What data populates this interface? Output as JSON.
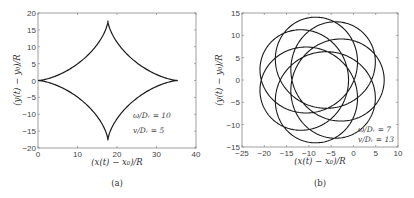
{
  "chart_data": [
    {
      "type": "line",
      "panel_caption": "(a)",
      "xlabel": "(x(t) − x₀)/R",
      "ylabel": "(y(t) − y₀)/R",
      "xlim": [
        0,
        40
      ],
      "ylim": [
        -20,
        20
      ],
      "xticks": [
        0,
        10,
        20,
        30,
        40
      ],
      "yticks": [
        -20,
        -15,
        -10,
        -5,
        0,
        5,
        10,
        15,
        20
      ],
      "grid": false,
      "annotations": [
        "ω/Dᵣ = 10",
        "v/Dᵣ = 5"
      ],
      "curve": {
        "shape": "astroid",
        "center": [
          17.7,
          0
        ],
        "radius": 17.7,
        "cusps": [
          [
            0,
            0
          ],
          [
            17.7,
            17.7
          ],
          [
            35.4,
            0
          ],
          [
            17.7,
            -17.7
          ]
        ]
      },
      "frame_px": {
        "left": 38,
        "top": 13,
        "right": 196,
        "bottom": 148
      }
    },
    {
      "type": "line",
      "panel_caption": "(b)",
      "xlabel": "(x(t) − x₀)/R",
      "ylabel": "(y(t) − y₀)/R",
      "xlim": [
        -25,
        10
      ],
      "ylim": [
        -15,
        15
      ],
      "xticks": [
        -25,
        -20,
        -15,
        -10,
        -5,
        0,
        5,
        10
      ],
      "yticks": [
        -15,
        -10,
        -5,
        0,
        5,
        10,
        15
      ],
      "grid": false,
      "annotations": [
        "ω/Dᵣ = 7",
        "v/Dᵣ = 13"
      ],
      "curve": {
        "shape": "looping-trochoid",
        "symmetry": 7,
        "center": [
          -7.3,
          0
        ],
        "r_small": 4.0,
        "r_large": 10.2,
        "extent_x": [
          -21,
          6.5
        ],
        "extent_y": [
          -14.2,
          14.2
        ]
      },
      "frame_px": {
        "left": 242,
        "top": 13,
        "right": 398,
        "bottom": 147
      }
    }
  ],
  "panels": {
    "a": {
      "caption": "(a)",
      "xlabel": "(x(t) − x₀)/R",
      "ylabel": "(y(t) − y₀)/R",
      "annot1": "ω/Dᵣ = 10",
      "annot2": "v/Dᵣ = 5"
    },
    "b": {
      "caption": "(b)",
      "xlabel": "(x(t) − x₀)/R",
      "ylabel": "(y(t) − y₀)/R",
      "annot1": "ω/Dᵣ = 7",
      "annot2": "v/Dᵣ = 13"
    }
  },
  "colors": {
    "curve": "#1a1a1a",
    "axis": "#777777",
    "tick_text": "#444444"
  }
}
